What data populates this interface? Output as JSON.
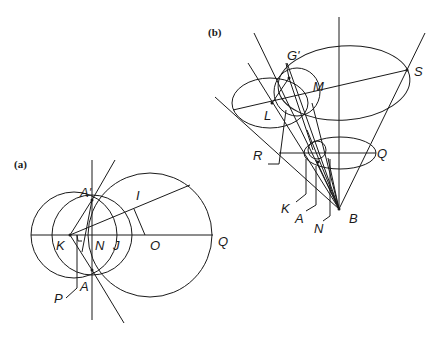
{
  "figure": {
    "panels": [
      {
        "id": "a",
        "label": "(a)",
        "points": {
          "A_prime": "A'",
          "I": "I",
          "K": "K",
          "N": "N",
          "J": "J",
          "O": "O",
          "Q": "Q",
          "P": "P",
          "A": "A"
        }
      },
      {
        "id": "b",
        "label": "(b)",
        "points": {
          "G_prime": "G'",
          "M": "M",
          "S": "S",
          "L": "L",
          "R": "R",
          "Q": "Q",
          "K": "K",
          "A": "A",
          "N": "N",
          "B": "B"
        }
      }
    ]
  }
}
